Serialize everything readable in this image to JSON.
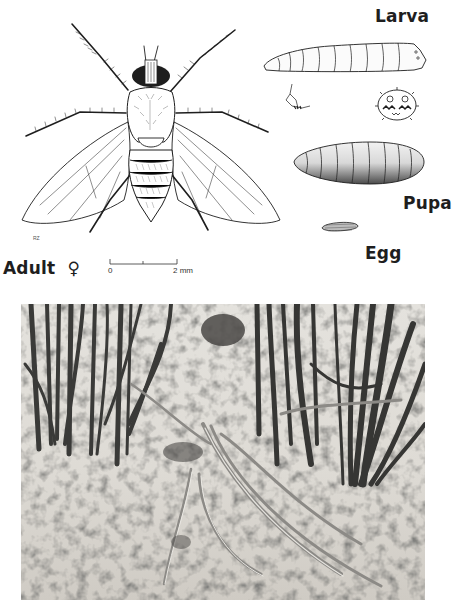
{
  "plate": {
    "illustration": {
      "adult": {
        "label": "Adult",
        "sex_symbol": "♀",
        "signature": "RZ"
      },
      "larva": {
        "label": "Larva"
      },
      "pupa": {
        "label": "Pupa"
      },
      "egg": {
        "label": "Egg"
      },
      "scale_bar": {
        "start_label": "0",
        "end_label": "2 mm"
      }
    },
    "photo": {
      "description": "Black-and-white photograph of grass/onion-like seedlings with wilted leaves lying on sandy soil"
    },
    "colors": {
      "ink": "#1e1e1e",
      "paper": "#ffffff",
      "photo_soil": "#d9d6d0",
      "photo_dark": "#3a3a38"
    }
  }
}
